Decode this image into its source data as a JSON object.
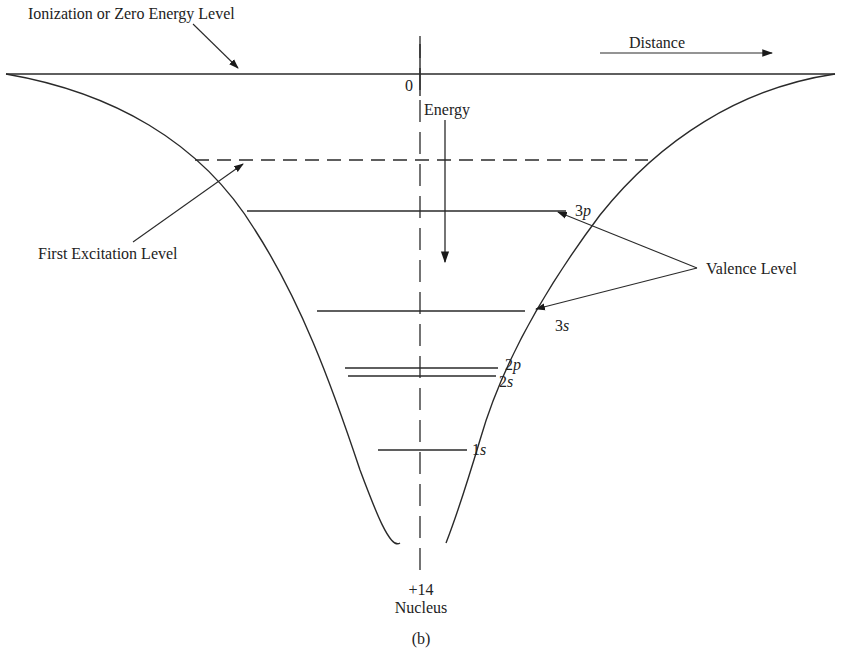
{
  "diagram": {
    "type": "energy-well-diagram",
    "caption": "(b)",
    "labels": {
      "ionization": "Ionization or Zero Energy Level",
      "distance": "Distance",
      "zero": "0",
      "energy": "Energy",
      "first_excitation": "First Excitation Level",
      "valence": "Valence Level",
      "nucleus_charge": "+14",
      "nucleus": "Nucleus"
    },
    "levels": [
      {
        "name": "3p",
        "num": "3",
        "orbital": "p"
      },
      {
        "name": "3s",
        "num": "3",
        "orbital": "s"
      },
      {
        "name": "2p",
        "num": "2",
        "orbital": "p"
      },
      {
        "name": "2s",
        "num": "2",
        "orbital": "s"
      },
      {
        "name": "1s",
        "num": "1",
        "orbital": "s"
      }
    ],
    "colors": {
      "line": "#2a2a2a",
      "text": "#222222",
      "background": "#ffffff"
    }
  }
}
